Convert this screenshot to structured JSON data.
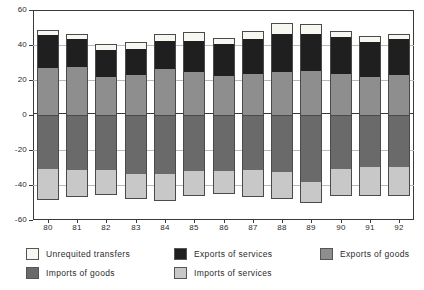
{
  "chart_data": {
    "type": "bar",
    "stacked": true,
    "title": "",
    "subtitle": "",
    "xlabel": "",
    "ylabel": "",
    "ylim": [
      -60,
      60
    ],
    "yticks": [
      60,
      40,
      20,
      0,
      -20,
      -40,
      -60
    ],
    "ytick_labels": [
      "60",
      "40",
      "20",
      "0",
      "-20",
      "-40",
      "-60"
    ],
    "grid": true,
    "legend_position": "bottom",
    "categories": [
      "80",
      "81",
      "82",
      "83",
      "84",
      "85",
      "86",
      "87",
      "88",
      "89",
      "90",
      "91",
      "92"
    ],
    "series": [
      {
        "name": "Exports of goods",
        "color": "#8e8e8e",
        "sign": "positive",
        "values": [
          27.5,
          28.0,
          22.5,
          23.5,
          27.0,
          25.0,
          23.0,
          24.0,
          25.0,
          25.5,
          24.0,
          22.5,
          23.5
        ]
      },
      {
        "name": "Exports of services",
        "color": "#1f1f1f",
        "sign": "positive",
        "values": [
          19.0,
          16.0,
          15.5,
          15.0,
          16.0,
          18.0,
          18.0,
          20.0,
          22.0,
          21.5,
          21.0,
          20.0,
          20.5
        ]
      },
      {
        "name": "Unrequited transfers",
        "color": "#f7f7f2",
        "sign": "positive",
        "values": [
          2.0,
          2.5,
          2.5,
          3.0,
          3.5,
          4.5,
          3.0,
          4.0,
          5.5,
          5.0,
          3.0,
          2.5,
          2.5
        ]
      },
      {
        "name": "Imports of goods",
        "color": "#6a6a6a",
        "sign": "negative",
        "values": [
          -31.0,
          -31.5,
          -31.5,
          -33.5,
          -33.5,
          -32.0,
          -32.0,
          -31.5,
          -32.5,
          -38.0,
          -31.0,
          -29.5,
          -29.5
        ]
      },
      {
        "name": "Imports of services",
        "color": "#c8c8c8",
        "sign": "negative",
        "values": [
          -17.0,
          -14.5,
          -13.5,
          -14.0,
          -15.0,
          -13.5,
          -12.5,
          -14.5,
          -15.0,
          -11.5,
          -14.5,
          -16.0,
          -16.0
        ]
      }
    ]
  },
  "legend": {
    "items": [
      {
        "label": "Unrequited transfers",
        "color": "#f7f7f2",
        "col": 0,
        "row": 0
      },
      {
        "label": "Exports of services",
        "color": "#1f1f1f",
        "col": 1,
        "row": 0
      },
      {
        "label": "Exports of goods",
        "color": "#8e8e8e",
        "col": 2,
        "row": 0
      },
      {
        "label": "Imports of goods",
        "color": "#6a6a6a",
        "col": 0,
        "row": 1
      },
      {
        "label": "Imports of services",
        "color": "#c8c8c8",
        "col": 1,
        "row": 1
      }
    ]
  }
}
